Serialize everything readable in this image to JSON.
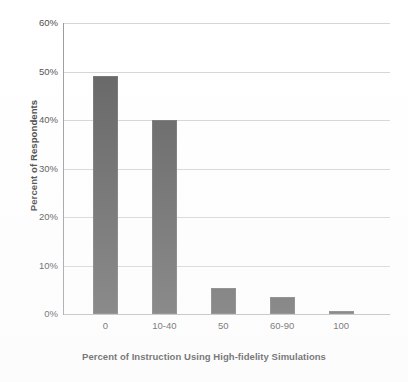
{
  "chart_data": {
    "type": "bar",
    "title": "",
    "categories": [
      "0",
      "10-40",
      "50",
      "60-90",
      "100"
    ],
    "values": [
      49,
      40,
      5.4,
      3.5,
      0.6
    ],
    "series": [
      {
        "name": "Percent of Respondents",
        "values": [
          49,
          40,
          5.4,
          3.5,
          0.6
        ]
      }
    ],
    "xlabel": "Percent of Instruction Using High-fidelity Simulations",
    "ylabel": "Percent of Respondents",
    "ylim": [
      0,
      60
    ],
    "ytick_values": [
      0,
      10,
      20,
      30,
      40,
      50,
      60
    ],
    "ytick_labels": [
      "0%",
      "10%",
      "20%",
      "30%",
      "40%",
      "50%",
      "60%"
    ],
    "grid": true,
    "legend": false,
    "legend_position": "none",
    "bar_color": "#5f5f5f",
    "gridline_color": "#d4d4d4",
    "axis_color": "#9a9a9a",
    "background_color": "#ffffff"
  }
}
